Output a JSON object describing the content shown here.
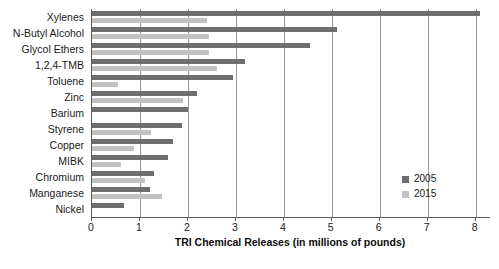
{
  "chart_data": {
    "type": "bar",
    "orientation": "horizontal",
    "title": "",
    "xlabel": "TRI Chemical Releases (in millions of pounds)",
    "ylabel": "",
    "xlim": [
      0,
      8.3
    ],
    "xticks": [
      0,
      1,
      2,
      3,
      4,
      5,
      6,
      7,
      8
    ],
    "grid": "vertical",
    "legend_position": "inside-lower-right",
    "categories": [
      "Xylenes",
      "N-Butyl Alcohol",
      "Glycol Ethers",
      "1,2,4-TMB",
      "Toluene",
      "Zinc",
      "Barium",
      "Styrene",
      "Copper",
      "MIBK",
      "Chromium",
      "Manganese",
      "Nickel"
    ],
    "series": [
      {
        "name": "2005",
        "color": "#6e6e6e",
        "values": [
          8.1,
          5.1,
          4.55,
          3.2,
          2.95,
          2.2,
          2.0,
          1.88,
          1.68,
          1.58,
          1.3,
          1.2,
          0.67
        ]
      },
      {
        "name": "2015",
        "color": "#c2c2c2",
        "values": [
          2.4,
          2.45,
          2.45,
          2.6,
          0.55,
          1.9,
          0,
          1.23,
          0.88,
          0.6,
          1.1,
          1.45,
          0
        ]
      }
    ]
  },
  "legend": {
    "items": [
      {
        "label": "2005",
        "color": "#6e6e6e"
      },
      {
        "label": "2015",
        "color": "#c2c2c2"
      }
    ]
  }
}
